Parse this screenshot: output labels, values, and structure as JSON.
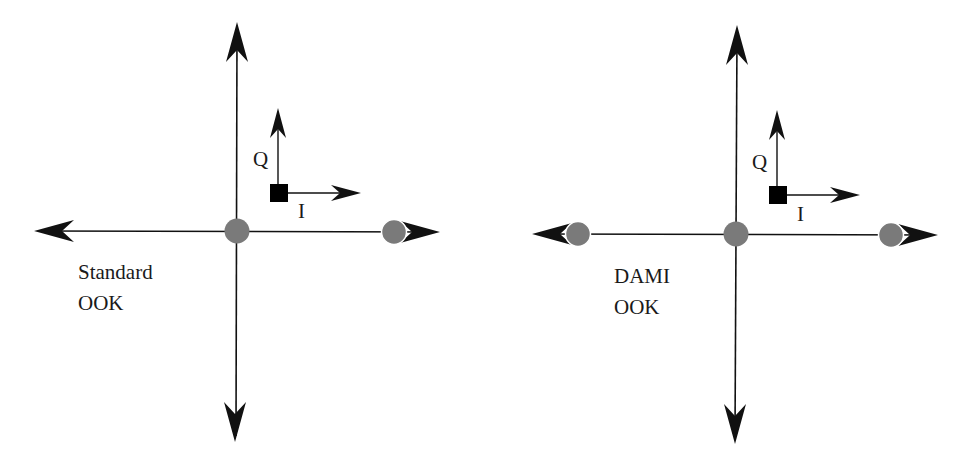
{
  "figure": {
    "panels": [
      {
        "id": "standard",
        "caption_line1": "Standard",
        "caption_line2": "OOK",
        "inset_axes": {
          "q_label": "Q",
          "i_label": "I"
        },
        "constellation_points": [
          {
            "label": "origin",
            "i": 0,
            "q": 0
          },
          {
            "label": "on",
            "i": 1,
            "q": 0
          }
        ]
      },
      {
        "id": "dami",
        "caption_line1": "DAMI",
        "caption_line2": "OOK",
        "inset_axes": {
          "q_label": "Q",
          "i_label": "I"
        },
        "constellation_points": [
          {
            "label": "negative",
            "i": -1,
            "q": 0
          },
          {
            "label": "origin",
            "i": 0,
            "q": 0
          },
          {
            "label": "positive",
            "i": 1,
            "q": 0
          }
        ]
      }
    ],
    "colors": {
      "axis": "#111111",
      "point_fill": "#7a7a7a",
      "marker_square": "#000000",
      "background": "#ffffff"
    }
  }
}
